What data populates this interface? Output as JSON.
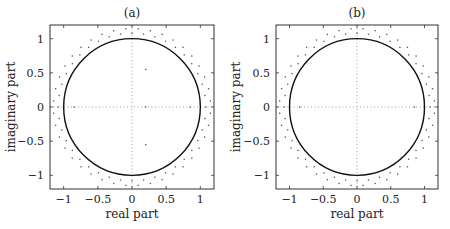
{
  "chart_data": [
    {
      "type": "scatter",
      "title": "(a)",
      "xlabel": "real part",
      "ylabel": "imaginary part",
      "xlim": [
        -1.2,
        1.2
      ],
      "ylim": [
        -1.2,
        1.2
      ],
      "xticks": [
        -1,
        -0.5,
        0,
        0.5,
        1
      ],
      "xtick_labels": [
        "−1",
        "−0.5",
        "0",
        "0.5",
        "1"
      ],
      "yticks": [
        -1,
        -0.5,
        0,
        0.5,
        1
      ],
      "ytick_labels": [
        "−1",
        "−0.5",
        "0",
        "0.5",
        "1"
      ],
      "grid": "dotted lines at x=0 and y=0",
      "series": [
        {
          "name": "unit circle",
          "kind": "line",
          "shape": "circle",
          "center": [
            0,
            0
          ],
          "radius": 1.0
        },
        {
          "name": "outer points ring 1",
          "kind": "points",
          "radius": 1.08,
          "count": 40
        },
        {
          "name": "outer points ring 2",
          "kind": "points",
          "radius": 1.15,
          "count": 40,
          "phase_offset_deg": 4.5
        },
        {
          "name": "interior points",
          "kind": "points",
          "points": [
            [
              0.2,
              0.55
            ],
            [
              0.2,
              -0.55
            ],
            [
              0.85,
              0
            ],
            [
              0.2,
              0
            ],
            [
              -0.85,
              0
            ]
          ]
        }
      ]
    },
    {
      "type": "scatter",
      "title": "(b)",
      "xlabel": "real part",
      "ylabel": "imaginary part",
      "xlim": [
        -1.2,
        1.2
      ],
      "ylim": [
        -1.2,
        1.2
      ],
      "xticks": [
        -1,
        -0.5,
        0,
        0.5,
        1
      ],
      "xtick_labels": [
        "−1",
        "−0.5",
        "0",
        "0.5",
        "1"
      ],
      "yticks": [
        -1,
        -0.5,
        0,
        0.5,
        1
      ],
      "ytick_labels": [
        "−1",
        "−0.5",
        "0",
        "0.5",
        "1"
      ],
      "grid": "dotted lines at x=0 and y=0",
      "series": [
        {
          "name": "unit circle",
          "kind": "line",
          "shape": "circle",
          "center": [
            0,
            0
          ],
          "radius": 1.0
        },
        {
          "name": "outer points ring 1",
          "kind": "points",
          "radius": 1.08,
          "count": 40
        },
        {
          "name": "outer points ring 2",
          "kind": "points",
          "radius": 1.15,
          "count": 40,
          "phase_offset_deg": 4.5
        },
        {
          "name": "interior points",
          "kind": "points",
          "points": [
            [
              0.85,
              0
            ],
            [
              -0.85,
              0
            ]
          ]
        }
      ]
    }
  ],
  "panels": [
    {
      "title": "(a)",
      "xlabel": "real part",
      "ylabel": "imaginary part"
    },
    {
      "title": "(b)",
      "xlabel": "real part",
      "ylabel": "imaginary part"
    }
  ]
}
